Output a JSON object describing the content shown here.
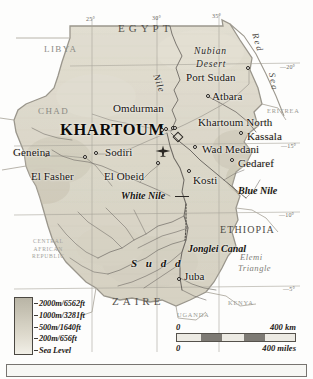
{
  "map": {
    "title": "Sudan",
    "projection_note": "",
    "background_color": "#fdfdfc",
    "land_color": "#ddd9cb",
    "border_color": "#9a968c"
  },
  "graticule": {
    "longitude_labels": [
      {
        "text": "25°",
        "x": 86,
        "y": 16
      },
      {
        "text": "30°",
        "x": 152,
        "y": 15
      },
      {
        "text": "35°",
        "x": 212,
        "y": 13
      }
    ],
    "latitude_labels": [
      {
        "text": "20°",
        "x": 290,
        "y": 64
      },
      {
        "text": "15°",
        "x": 291,
        "y": 143
      },
      {
        "text": "10°",
        "x": 289,
        "y": 212
      },
      {
        "text": "5°",
        "x": 293,
        "y": 286
      }
    ]
  },
  "cities": [
    {
      "name": "KHARTOUM",
      "style": "capital",
      "label_x": 60,
      "label_y": 122,
      "dot_x": 167,
      "dot_y": 130,
      "dot2_x": 174,
      "dot2_y": 129
    },
    {
      "name": "Omdurman",
      "style": "city",
      "label_x": 113,
      "label_y": 103,
      "dot_x": 163,
      "dot_y": 131
    },
    {
      "name": "Port Sudan",
      "style": "city",
      "label_x": 186,
      "label_y": 72,
      "dot_x": 249,
      "dot_y": 69
    },
    {
      "name": "Atbara",
      "style": "city",
      "label_x": 212,
      "label_y": 91,
      "dot_x": 209,
      "dot_y": 97
    },
    {
      "name": "Khartoum North",
      "style": "city",
      "label_x": 198,
      "label_y": 117,
      "dot_x": 176,
      "dot_y": 129
    },
    {
      "name": "Kassala",
      "style": "city",
      "label_x": 247,
      "label_y": 131,
      "dot_x": 242,
      "dot_y": 134
    },
    {
      "name": "Wad Medani",
      "style": "city",
      "label_x": 202,
      "label_y": 144,
      "dot_x": 196,
      "dot_y": 148
    },
    {
      "name": "Gedaref",
      "style": "city",
      "label_x": 238,
      "label_y": 158,
      "dot_x": 233,
      "dot_y": 161
    },
    {
      "name": "Geneina",
      "style": "city",
      "label_x": 13,
      "label_y": 147,
      "dot_x": 47,
      "dot_y": 156
    },
    {
      "name": "Sodiri",
      "style": "city",
      "label_x": 105,
      "label_y": 147,
      "dot_x": 97,
      "dot_y": 154
    },
    {
      "name": "El Fasher",
      "style": "city",
      "label_x": 31,
      "label_y": 171,
      "dot_x": 86,
      "dot_y": 158
    },
    {
      "name": "El Obeid",
      "style": "city",
      "label_x": 104,
      "label_y": 171,
      "dot_x": 159,
      "dot_y": 164
    },
    {
      "name": "Kosti",
      "style": "city",
      "label_x": 193,
      "label_y": 175,
      "dot_x": 190,
      "dot_y": 172
    },
    {
      "name": "Juba",
      "style": "city",
      "label_x": 184,
      "label_y": 271,
      "dot_x": 180,
      "dot_y": 280
    }
  ],
  "countries": [
    {
      "name": "EGYPT",
      "class": "country-wide",
      "x": 118,
      "y": 23
    },
    {
      "name": "LIBYA",
      "class": "country",
      "x": 44,
      "y": 45
    },
    {
      "name": "CHAD",
      "class": "country",
      "x": 38,
      "y": 107
    },
    {
      "name": "ERITREA",
      "class": "country-xs",
      "x": 267,
      "y": 108
    },
    {
      "name": "ETHIOPIA",
      "class": "country-dk",
      "x": 220,
      "y": 225
    },
    {
      "name": "ZAIRE",
      "class": "country-wide",
      "x": 112,
      "y": 296
    },
    {
      "name": "UGANDA",
      "class": "country-xs",
      "x": 177,
      "y": 312
    },
    {
      "name": "KENYA",
      "class": "country-xs",
      "x": 228,
      "y": 300
    }
  ],
  "country_multiline": {
    "name_lines": [
      "CENTRAL",
      "AFRICAN",
      "REPUBLIC"
    ],
    "x": 32,
    "y": 238
  },
  "physical_labels": [
    {
      "text": "Nubian",
      "class": "phys",
      "x": 194,
      "y": 47
    },
    {
      "text": "Desert",
      "class": "phys",
      "x": 196,
      "y": 60
    },
    {
      "text": "Nile",
      "class": "phys",
      "x": 160,
      "y": 73,
      "rotate": 72
    },
    {
      "text": "Red",
      "class": "phys-sea",
      "x": 259,
      "y": 32,
      "rotate": 74
    },
    {
      "text": "Sea",
      "class": "phys-sea",
      "x": 276,
      "y": 72,
      "rotate": 80
    },
    {
      "text": "White Nile",
      "class": "phys-b",
      "x": 121,
      "y": 191
    },
    {
      "text": "Blue Nile",
      "class": "phys-b",
      "x": 238,
      "y": 186
    },
    {
      "text": "Jonglei Canal",
      "class": "phys-b",
      "x": 188,
      "y": 244
    },
    {
      "text": "S u d d",
      "class": "phys-wide",
      "x": 131,
      "y": 258
    }
  ],
  "region_labels": [
    {
      "text": "Elemi",
      "class": "phys-gray",
      "x": 240,
      "y": 252
    },
    {
      "text": "Triangle",
      "class": "phys-gray",
      "x": 238,
      "y": 263
    }
  ],
  "legend": {
    "title": "",
    "entries": [
      {
        "label": "2000m/6562ft"
      },
      {
        "label": "1000m/3281ft"
      },
      {
        "label": "500m/1640ft"
      },
      {
        "label": "200m/656ft"
      },
      {
        "label": "Sea Level"
      }
    ]
  },
  "scalebar": {
    "km_start": "0",
    "km_end": "400 km",
    "miles_start": "0",
    "miles_end": "400 miles"
  }
}
